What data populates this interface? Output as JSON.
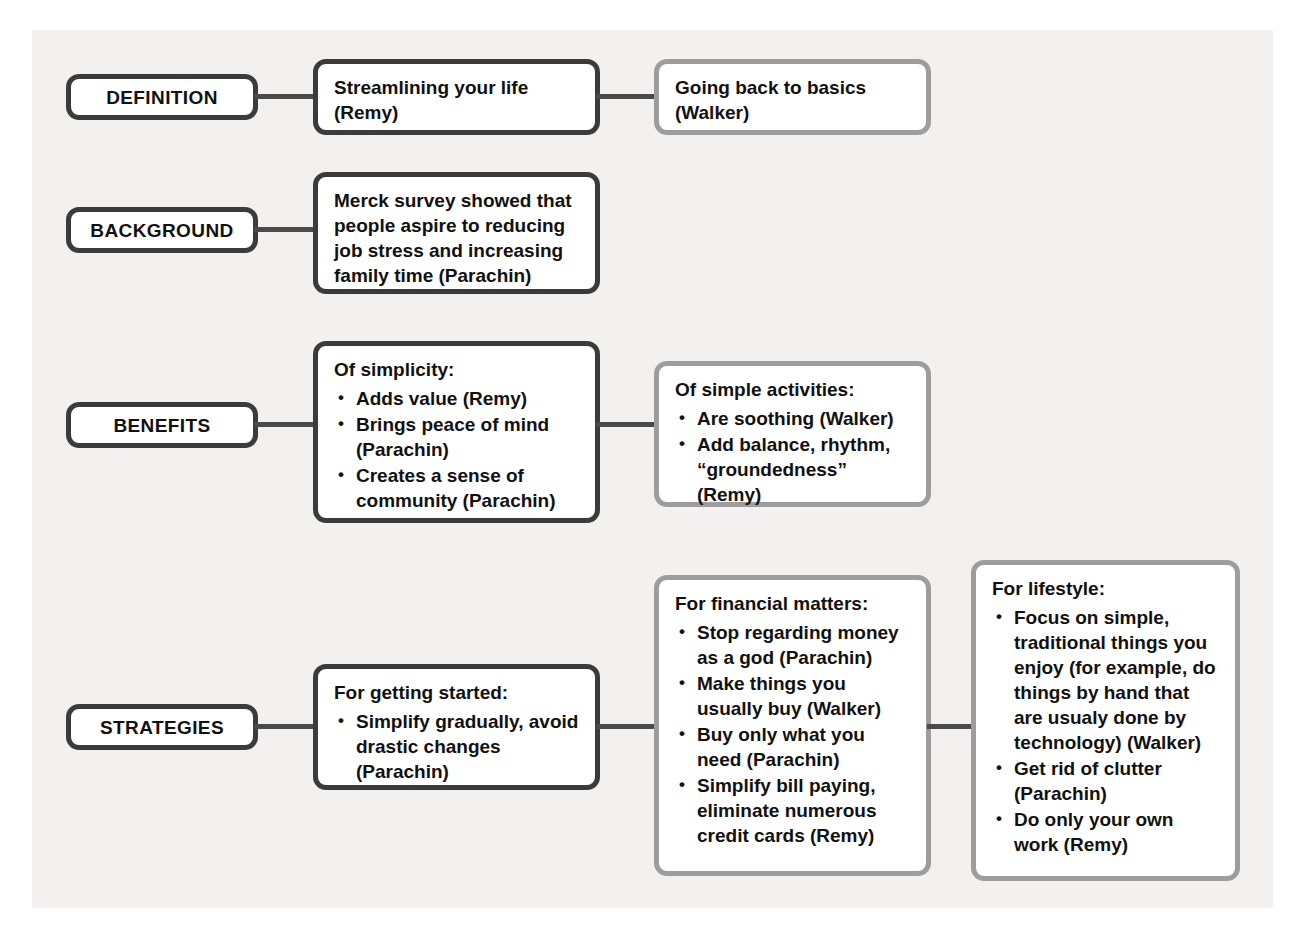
{
  "diagram": {
    "rows": [
      {
        "label": "DEFINITION",
        "boxes": [
          {
            "style": "dark",
            "plain": "Streamlining your life (Remy)"
          },
          {
            "style": "light",
            "plain": "Going back to basics (Walker)"
          }
        ]
      },
      {
        "label": "BACKGROUND",
        "boxes": [
          {
            "style": "dark",
            "plain": "Merck survey showed that people aspire to reducing job stress and increasing family time (Parachin)"
          }
        ]
      },
      {
        "label": "BENEFITS",
        "boxes": [
          {
            "style": "dark",
            "heading": "Of simplicity:",
            "items": [
              "Adds value (Remy)",
              "Brings peace of mind (Parachin)",
              "Creates a sense of community (Parachin)"
            ]
          },
          {
            "style": "light",
            "heading": "Of simple activities:",
            "items": [
              "Are soothing (Walker)",
              "Add balance, rhythm, “groundedness” (Remy)"
            ]
          }
        ]
      },
      {
        "label": "STRATEGIES",
        "boxes": [
          {
            "style": "dark",
            "heading": "For getting started:",
            "items": [
              "Simplify gradually, avoid drastic changes (Parachin)"
            ]
          },
          {
            "style": "light",
            "heading": "For financial matters:",
            "items": [
              "Stop regarding money as a god (Parachin)",
              "Make things you usually buy (Walker)",
              "Buy only what you need (Parachin)",
              "Simplify bill paying, eliminate numerous credit cards (Remy)"
            ]
          },
          {
            "style": "light",
            "heading": "For lifestyle:",
            "items": [
              "Focus on simple, traditional things you enjoy (for example, do things by hand that are usualy done by technology) (Walker)",
              "Get rid of clutter (Parachin)",
              "Do only your own work (Remy)"
            ]
          }
        ]
      }
    ],
    "colors": {
      "panel_background": "#f2f1ef",
      "dark_border": "#3b3b3b",
      "light_border": "#9d9d9d",
      "connector": "#4a4a4a",
      "box_fill": "#ffffff",
      "text": "#111111"
    }
  }
}
